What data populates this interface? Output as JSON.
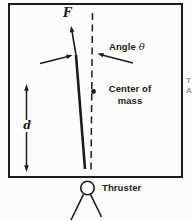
{
  "figure": {
    "kind": "thruster-rocket-free-body-diagram",
    "labels": {
      "force": "F",
      "angle_word": "Angle",
      "angle_symbol": "θ",
      "center_of_mass_line1": "Center of",
      "center_of_mass_line2": "mass",
      "distance": "d",
      "thruster": "Thruster",
      "edge_fragment_line1": "T",
      "edge_fragment_line2": "A"
    },
    "colors": {
      "ink": "#1c1c1c",
      "background": "#fcfcfa",
      "faint_text": "#97978f"
    }
  }
}
